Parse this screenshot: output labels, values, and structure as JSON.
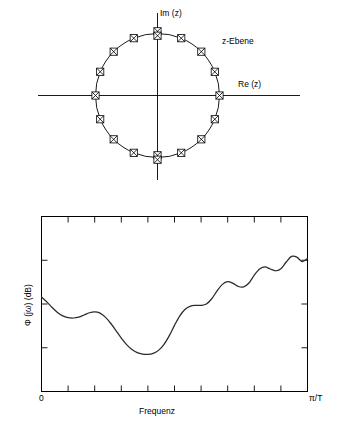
{
  "figure": {
    "panels": [
      {
        "id": "z-plane",
        "label": "z-Ebene",
        "axis_imag_label": "Im (z)",
        "axis_real_label": "Re (z)",
        "marker": "zero-crossed-box",
        "circle": "unit-circle"
      },
      {
        "id": "magnitude-response",
        "ylabel": "Φ (jω) (dB)",
        "xlabel": "Frequenz",
        "xtick_left": "0",
        "xtick_right": "π/T"
      }
    ]
  },
  "chart_data": [
    {
      "type": "scatter",
      "title": "z-Ebene",
      "xlabel": "Re (z)",
      "ylabel": "Im (z)",
      "xlim": [
        -1.45,
        1.45
      ],
      "ylim": [
        -1.45,
        1.45
      ],
      "grid": false,
      "legend": "none",
      "annotations": [
        "z-Ebene"
      ],
      "series": [
        {
          "name": "Nullstellen auf dem Einheitskreis",
          "marker": "crossed-square (zero)",
          "radius": 1.0,
          "angles_deg": [
            0,
            22.5,
            45,
            67.5,
            90,
            112.5,
            135,
            157.5,
            180,
            202.5,
            225,
            247.5,
            270,
            292.5,
            315,
            337.5
          ],
          "multiplicity": [
            1,
            1,
            1,
            1,
            2,
            1,
            1,
            1,
            1,
            1,
            1,
            1,
            2,
            1,
            1,
            1
          ],
          "x": [
            1.0,
            0.924,
            0.707,
            0.383,
            0.0,
            -0.383,
            -0.707,
            -0.924,
            -1.0,
            -0.924,
            -0.707,
            -0.383,
            0.0,
            0.383,
            0.707,
            0.924
          ],
          "y": [
            0.0,
            0.383,
            0.707,
            0.924,
            1.0,
            0.924,
            0.707,
            0.383,
            0.0,
            -0.383,
            -0.707,
            -0.924,
            -1.0,
            -0.924,
            -0.707,
            -0.383
          ]
        }
      ]
    },
    {
      "type": "line",
      "title": "",
      "xlabel": "Frequenz",
      "ylabel": "Φ (jω) (dB)",
      "xlim": [
        0,
        1
      ],
      "ylim": [
        0,
        1
      ],
      "xtick_labels": [
        "0",
        "π/T"
      ],
      "ytick_labels": [],
      "grid": false,
      "legend": "none",
      "x": [
        0.0,
        0.02,
        0.04,
        0.06,
        0.08,
        0.1,
        0.12,
        0.14,
        0.16,
        0.18,
        0.2,
        0.22,
        0.24,
        0.26,
        0.28,
        0.3,
        0.32,
        0.34,
        0.36,
        0.38,
        0.4,
        0.42,
        0.44,
        0.46,
        0.48,
        0.5,
        0.52,
        0.54,
        0.56,
        0.58,
        0.6,
        0.62,
        0.64,
        0.66,
        0.68,
        0.7,
        0.72,
        0.74,
        0.76,
        0.78,
        0.8,
        0.82,
        0.84,
        0.86,
        0.88,
        0.9,
        0.92,
        0.94,
        0.96,
        0.98,
        1.0
      ],
      "y": [
        0.54,
        0.512,
        0.48,
        0.452,
        0.432,
        0.422,
        0.42,
        0.425,
        0.437,
        0.45,
        0.455,
        0.448,
        0.425,
        0.39,
        0.348,
        0.305,
        0.268,
        0.24,
        0.222,
        0.214,
        0.212,
        0.218,
        0.235,
        0.268,
        0.318,
        0.378,
        0.432,
        0.47,
        0.488,
        0.492,
        0.492,
        0.5,
        0.53,
        0.575,
        0.612,
        0.628,
        0.618,
        0.6,
        0.598,
        0.62,
        0.665,
        0.7,
        0.712,
        0.7,
        0.69,
        0.702,
        0.74,
        0.772,
        0.768,
        0.742,
        0.76
      ]
    }
  ]
}
